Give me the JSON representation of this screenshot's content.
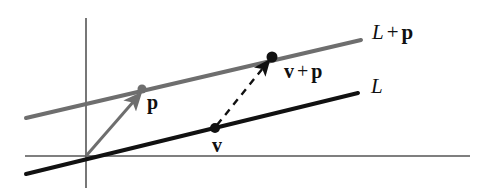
{
  "figure": {
    "kind": "vector-geometry-diagram",
    "background_color": "#ffffff"
  },
  "colors": {
    "line_L": "#111111",
    "line_L_plus_p": "#6e6e6e",
    "axis": "#555555",
    "vector_p_arrow": "#6e6e6e",
    "vector_dashed_arrow": "#111111",
    "dot_p": "#6e6e6e",
    "dot_v": "#111111",
    "dot_v_plus_p": "#111111",
    "label_text": "#101010"
  },
  "axes": {
    "origin": {
      "x": 86,
      "y": 156
    },
    "x_axis": {
      "x1": 25,
      "y1": 156,
      "x2": 470,
      "y2": 156
    },
    "y_axis": {
      "x1": 86,
      "y1": 18,
      "x2": 86,
      "y2": 188
    }
  },
  "lines": [
    {
      "name": "L",
      "label": "L",
      "style": "solid",
      "color": "#111111",
      "width": 4,
      "x1": 26,
      "y1": 174,
      "x2": 358,
      "y2": 93
    },
    {
      "name": "L + p",
      "label_prefix": "L",
      "label_operator": "+",
      "label_suffix": "p",
      "style": "solid",
      "color": "#6e6e6e",
      "width": 4,
      "x1": 26,
      "y1": 118,
      "x2": 361,
      "y2": 40
    }
  ],
  "points": [
    {
      "name": "p",
      "label": "p",
      "x": 142,
      "y": 89,
      "radius": 4.5,
      "color": "#6e6e6e",
      "on_line": "L + p"
    },
    {
      "name": "v",
      "label": "v",
      "x": 215,
      "y": 128,
      "radius": 5,
      "color": "#111111",
      "on_line": "L"
    },
    {
      "name": "v + p",
      "label_prefix": "v",
      "label_operator": "+",
      "label_suffix": "p",
      "x": 272,
      "y": 57,
      "radius": 5.5,
      "color": "#111111",
      "on_line": "L + p"
    }
  ],
  "vectors": [
    {
      "name": "p-vector",
      "style": "solid",
      "color": "#6e6e6e",
      "width": 3,
      "from": {
        "x": 86,
        "y": 156
      },
      "to": {
        "x": 136,
        "y": 99
      },
      "arrowhead": true
    },
    {
      "name": "translation-vector",
      "style": "dashed",
      "color": "#111111",
      "width": 2.4,
      "dash": "7 6",
      "from": {
        "x": 217,
        "y": 125
      },
      "to": {
        "x": 265,
        "y": 66
      },
      "arrowhead": true
    }
  ],
  "labels": {
    "line_L_plus_p": {
      "base": "L",
      "operator": "+",
      "vector": "p"
    },
    "line_L": {
      "base": "L"
    },
    "point_v_plus_p": {
      "base": "v",
      "operator": "+",
      "vector": "p"
    },
    "point_p": {
      "text": "p"
    },
    "point_v": {
      "text": "v"
    }
  }
}
